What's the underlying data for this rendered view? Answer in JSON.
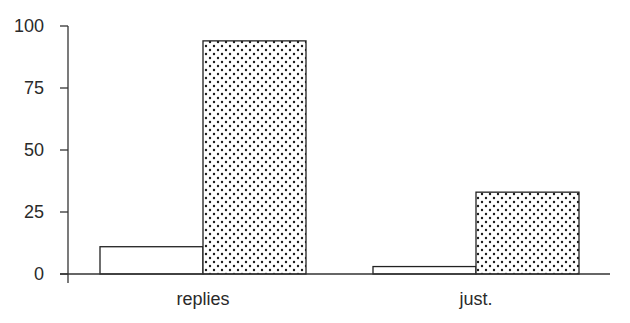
{
  "chart_data": {
    "type": "bar",
    "title": "",
    "xlabel": "",
    "ylabel": "",
    "categories": [
      "replies",
      "just."
    ],
    "series": [
      {
        "name": "series 1 (plain)",
        "fill": "none",
        "values": [
          11,
          3
        ]
      },
      {
        "name": "series 2 (dotted)",
        "fill": "dots",
        "values": [
          94,
          33
        ]
      }
    ],
    "ylim": [
      0,
      100
    ],
    "yticks": [
      0,
      25,
      50,
      75,
      100
    ],
    "grid": false,
    "legend": null
  },
  "colors": {
    "axis": "#333333",
    "bar_outline": "#222222",
    "dot": "#1a1a1a",
    "background": "#ffffff"
  }
}
